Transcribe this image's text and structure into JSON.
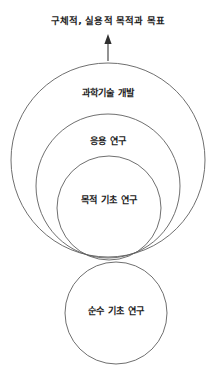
{
  "diagram": {
    "type": "nested-circles",
    "title_text": "구체적, 실용적 목적과 목표",
    "arrow": {
      "name": "upward-arrow",
      "direction": "up",
      "from_y": 61,
      "to_y": 35,
      "x": 108
    },
    "circles": [
      {
        "id": "tech-development",
        "label": "과학기술 개발",
        "cx": 108,
        "cy": 160,
        "r": 97,
        "label_x": 108,
        "label_y": 93
      },
      {
        "id": "applied-research",
        "label": "응용 연구",
        "cx": 108,
        "cy": 186,
        "r": 72,
        "label_x": 108,
        "label_y": 141
      },
      {
        "id": "oriented-basic-research",
        "label": "목적 기초 연구",
        "cx": 109,
        "cy": 208,
        "r": 52,
        "label_x": 109,
        "label_y": 200
      },
      {
        "id": "pure-basic-research",
        "label": "순수 기초 연구",
        "cx": 116,
        "cy": 313,
        "r": 51,
        "label_x": 116,
        "label_y": 311
      }
    ],
    "colors": {
      "stroke": "#5f5f5f",
      "arrow": "#2e2e2e",
      "text": "#1c1c1c",
      "background": "#ffffff"
    }
  }
}
